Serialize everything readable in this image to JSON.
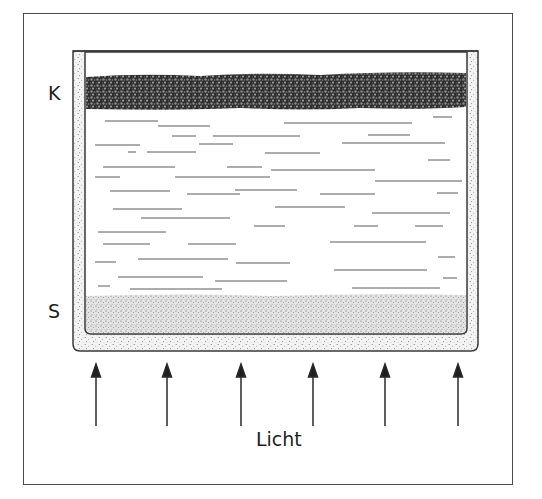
{
  "diagram": {
    "labels": {
      "top_layer": "K",
      "bottom_layer": "S",
      "light": "Licht"
    },
    "colors": {
      "frame": "#4a4a4a",
      "ink": "#1e1e1e",
      "pebble_layer": "#3a3a3a",
      "sand_layer": "#d9d9d9",
      "background": "#ffffff"
    },
    "arrows": {
      "count": 6,
      "direction": "up",
      "x_positions": [
        96,
        167,
        241,
        313,
        385,
        458
      ]
    },
    "layers": [
      {
        "id": "K",
        "type": "dark-pebble-layer",
        "position": "top"
      },
      {
        "id": "water",
        "type": "water-with-horizontal-lines",
        "position": "middle"
      },
      {
        "id": "S",
        "type": "sand-layer",
        "position": "bottom"
      }
    ]
  }
}
